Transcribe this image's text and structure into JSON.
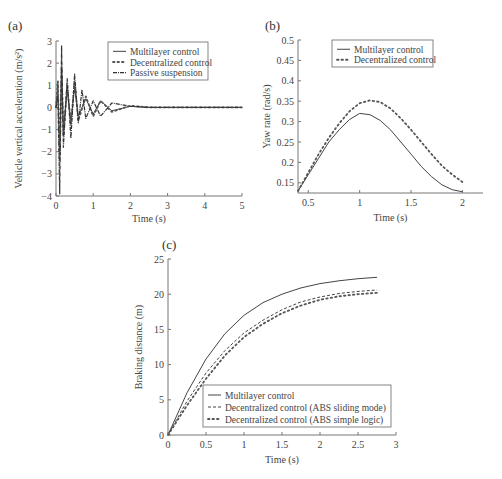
{
  "chart_data": [
    {
      "panel": "(a)",
      "type": "line",
      "title": "",
      "xlabel": "Time (s)",
      "ylabel": "Vehicle vertical acceleration (m/s²)",
      "xlim": [
        0,
        5
      ],
      "ylim": [
        -4,
        3
      ],
      "xticks": [
        "0",
        "1",
        "2",
        "3",
        "4",
        "5"
      ],
      "yticks": [
        "-4",
        "-3",
        "-2",
        "-1",
        "0",
        "1",
        "2",
        "3"
      ],
      "grid": false,
      "legend_position": "upper right",
      "series": [
        {
          "name": "Multilayer control",
          "style": "solid",
          "x": [
            0,
            0.05,
            0.1,
            0.15,
            0.2,
            0.3,
            0.4,
            0.5,
            0.6,
            0.8,
            1.0,
            1.2,
            1.5,
            2.0,
            2.5,
            3.0,
            5.0
          ],
          "y": [
            0,
            1.0,
            -2.0,
            1.6,
            -1.0,
            0.8,
            -0.6,
            0.9,
            -0.4,
            0.4,
            -0.3,
            0.3,
            -0.15,
            0.05,
            0,
            0,
            0
          ]
        },
        {
          "name": "Decentralized control",
          "style": "dotted",
          "x": [
            0,
            0.05,
            0.1,
            0.15,
            0.2,
            0.3,
            0.4,
            0.5,
            0.6,
            0.8,
            1.0,
            1.2,
            1.5,
            2.0,
            2.5,
            3.0,
            5.0
          ],
          "y": [
            0,
            1.2,
            -2.4,
            1.8,
            -1.3,
            1.0,
            -0.8,
            1.2,
            -0.6,
            0.5,
            -0.4,
            0.3,
            -0.2,
            0.08,
            0,
            0,
            0
          ]
        },
        {
          "name": "Passive suspension",
          "style": "dash-dot-marker",
          "x": [
            0,
            0.05,
            0.1,
            0.15,
            0.2,
            0.3,
            0.4,
            0.5,
            0.6,
            0.7,
            0.8,
            1.0,
            1.2,
            1.5,
            2.0,
            2.5,
            3.0,
            5.0
          ],
          "y": [
            0,
            0.5,
            -3.9,
            2.8,
            -1.8,
            1.3,
            -1.4,
            1.5,
            -0.7,
            0.8,
            -0.5,
            0.3,
            -0.4,
            0.2,
            0.05,
            0,
            0,
            0
          ]
        }
      ]
    },
    {
      "panel": "(b)",
      "type": "line",
      "title": "",
      "xlabel": "Time (s)",
      "ylabel": "Yaw rate (rad/s)",
      "xlim": [
        0.4,
        2.2
      ],
      "ylim": [
        0.125,
        0.5
      ],
      "xticks": [
        "0.5",
        "1",
        "1.5",
        "2"
      ],
      "yticks": [
        "0.15",
        "0.2",
        "0.25",
        "0.3",
        "0.35",
        "0.4",
        "0.45",
        "0.5"
      ],
      "grid": false,
      "legend_position": "upper center",
      "series": [
        {
          "name": "Multilayer control",
          "style": "solid",
          "x": [
            0.4,
            0.5,
            0.6,
            0.7,
            0.8,
            0.9,
            1.0,
            1.1,
            1.2,
            1.3,
            1.4,
            1.5,
            1.6,
            1.7,
            1.8,
            1.9,
            2.0
          ],
          "y": [
            0.13,
            0.17,
            0.21,
            0.25,
            0.28,
            0.305,
            0.32,
            0.317,
            0.303,
            0.28,
            0.25,
            0.22,
            0.19,
            0.165,
            0.145,
            0.133,
            0.128
          ]
        },
        {
          "name": "Decentralized control",
          "style": "dotted",
          "x": [
            0.4,
            0.5,
            0.6,
            0.7,
            0.8,
            0.9,
            1.0,
            1.1,
            1.2,
            1.3,
            1.4,
            1.5,
            1.6,
            1.7,
            1.8,
            1.9,
            2.0
          ],
          "y": [
            0.13,
            0.175,
            0.22,
            0.26,
            0.295,
            0.325,
            0.345,
            0.352,
            0.348,
            0.332,
            0.308,
            0.28,
            0.25,
            0.22,
            0.192,
            0.17,
            0.152
          ]
        }
      ]
    },
    {
      "panel": "(c)",
      "type": "line",
      "title": "",
      "xlabel": "Time (s)",
      "ylabel": "Braking distance (m)",
      "xlim": [
        0,
        3
      ],
      "ylim": [
        0,
        25
      ],
      "xticks": [
        "0",
        "0.5",
        "1",
        "1.5",
        "2",
        "2.5",
        "3"
      ],
      "yticks": [
        "0",
        "5",
        "10",
        "15",
        "20",
        "25"
      ],
      "grid": false,
      "legend_position": "lower right",
      "series": [
        {
          "name": "Multilayer control",
          "style": "solid",
          "x": [
            0,
            0.25,
            0.5,
            0.75,
            1.0,
            1.25,
            1.5,
            1.75,
            2.0,
            2.25,
            2.5,
            2.75
          ],
          "y": [
            0,
            6.0,
            10.8,
            14.4,
            17.0,
            18.8,
            20.0,
            20.9,
            21.5,
            21.9,
            22.2,
            22.4
          ]
        },
        {
          "name": "Decentralized control (ABS sliding mode)",
          "style": "dashed",
          "x": [
            0,
            0.25,
            0.5,
            0.75,
            1.0,
            1.25,
            1.5,
            1.75,
            2.0,
            2.25,
            2.5,
            2.75
          ],
          "y": [
            0,
            4.8,
            8.8,
            12.0,
            14.5,
            16.3,
            17.8,
            18.9,
            19.6,
            20.1,
            20.4,
            20.6
          ]
        },
        {
          "name": "Decentralized control (ABS simple logic)",
          "style": "dotted",
          "x": [
            0,
            0.25,
            0.5,
            0.75,
            1.0,
            1.25,
            1.5,
            1.75,
            2.0,
            2.25,
            2.5,
            2.75
          ],
          "y": [
            0,
            4.2,
            8.0,
            11.3,
            13.9,
            15.8,
            17.3,
            18.4,
            19.2,
            19.7,
            20.0,
            20.2
          ]
        }
      ]
    }
  ],
  "figure": {
    "panels": [
      {
        "label": "(a)"
      },
      {
        "label": "(b)"
      },
      {
        "label": "(c)"
      }
    ]
  }
}
